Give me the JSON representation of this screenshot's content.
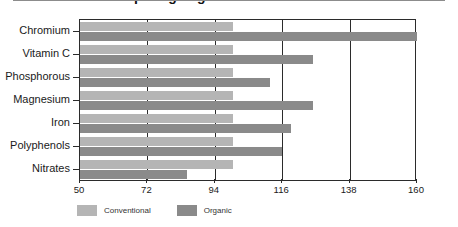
{
  "chart_data": {
    "type": "bar",
    "orientation": "horizontal",
    "title": "Comparing Organic and Conventional",
    "xlabel": "",
    "ylabel": "",
    "xlim": [
      50,
      160
    ],
    "xticks": [
      50,
      72,
      94,
      116,
      138,
      160
    ],
    "grid": true,
    "legend_position": "bottom-left",
    "categories": [
      "Chromium",
      "Vitamin C",
      "Phosphorous",
      "Magnesium",
      "Iron",
      "Polyphenols",
      "Nitrates"
    ],
    "series": [
      {
        "name": "Conventional",
        "color": "#b5b5b5",
        "values": [
          100,
          100,
          100,
          100,
          100,
          100,
          100
        ]
      },
      {
        "name": "Organic",
        "color": "#8a8a8a",
        "values": [
          160,
          126,
          112,
          126,
          119,
          116,
          85
        ]
      }
    ]
  },
  "axis": {
    "tick_labels": [
      "50",
      "72",
      "94",
      "116",
      "138",
      "160"
    ]
  },
  "legend": {
    "entries": [
      {
        "label": "Conventional",
        "color": "#b5b5b5"
      },
      {
        "label": "Organic",
        "color": "#8a8a8a"
      }
    ]
  },
  "colors": {
    "conventional": "#b5b5b5",
    "organic": "#8a8a8a",
    "axis": "#2b2b2b",
    "rule": "#8c8c8c",
    "background": "#ffffff"
  }
}
